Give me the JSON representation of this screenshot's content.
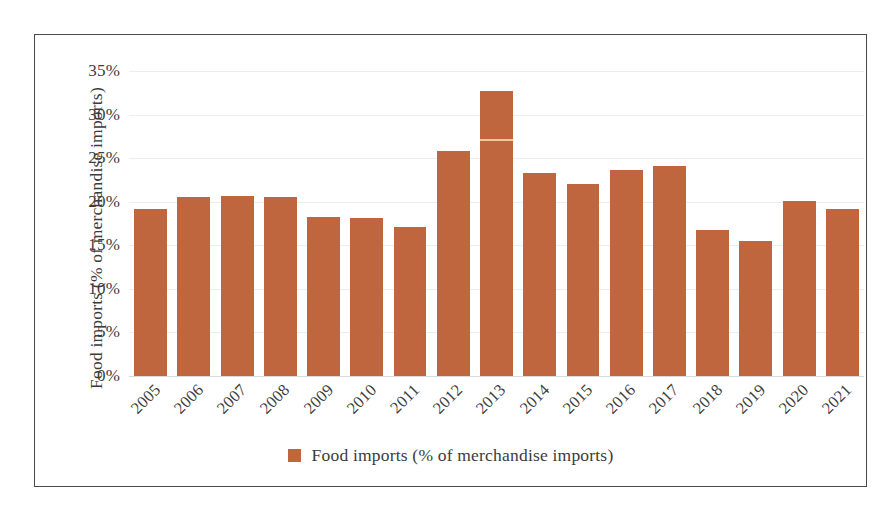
{
  "chart_data": {
    "type": "bar",
    "title": "",
    "xlabel": "",
    "ylabel": "Food imports (% of merchandise imports)",
    "ylim": [
      0,
      35
    ],
    "ytick_labels": [
      "0%",
      "5%",
      "10%",
      "15%",
      "20%",
      "25%",
      "30%",
      "35%"
    ],
    "ytick_values": [
      0,
      5,
      10,
      15,
      20,
      25,
      30,
      35
    ],
    "grid": true,
    "legend_position": "bottom",
    "legend": [
      "Food imports (% of merchandise imports)"
    ],
    "series_color": "#c0663f",
    "categories": [
      "2005",
      "2006",
      "2007",
      "2008",
      "2009",
      "2010",
      "2011",
      "2012",
      "2013",
      "2014",
      "2015",
      "2016",
      "2017",
      "2018",
      "2019",
      "2020",
      "2021"
    ],
    "series": [
      {
        "name": "Food imports (% of merchandise imports)",
        "color": "#c0663f",
        "values": [
          19.2,
          20.5,
          20.7,
          20.5,
          18.2,
          18.1,
          17.1,
          25.8,
          32.7,
          23.3,
          22.0,
          23.6,
          24.1,
          16.7,
          15.5,
          20.1,
          19.2
        ]
      }
    ]
  },
  "legend": {
    "label": "Food imports (% of merchandise imports)",
    "swatch_color": "#c0663f"
  },
  "axes": {
    "y_title": "Food imports (% of merchandise imports)"
  }
}
